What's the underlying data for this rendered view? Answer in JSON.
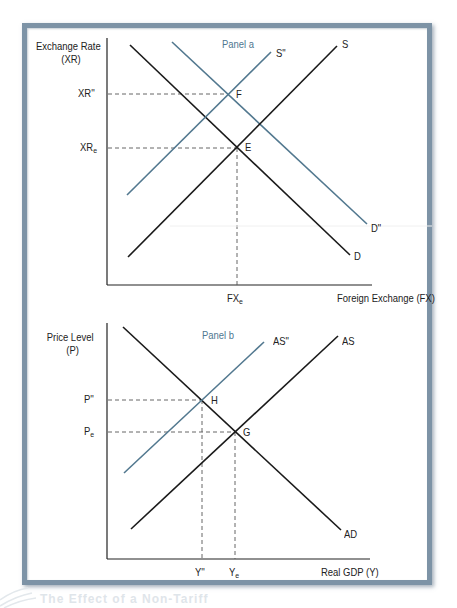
{
  "panel_a": {
    "title": "Panel a",
    "y_axis_label_line1": "Exchange Rate",
    "y_axis_label_line2": "(XR)",
    "x_axis_label": "Foreign Exchange (FX)",
    "y_ticks": [
      {
        "label": "XR''",
        "sub": ""
      },
      {
        "label": "XR",
        "sub": "e"
      }
    ],
    "x_ticks": [
      {
        "label": "FX",
        "sub": "e"
      }
    ],
    "curves": {
      "S": "S",
      "S2": "S\"",
      "D": "D",
      "D2": "D\""
    },
    "points": {
      "E": "E",
      "F": "F"
    }
  },
  "panel_b": {
    "title": "Panel b",
    "y_axis_label_line1": "Price Level",
    "y_axis_label_line2": "(P)",
    "x_axis_label": "Real GDP (Y)",
    "y_ticks": [
      {
        "label": "P''",
        "sub": ""
      },
      {
        "label": "P",
        "sub": "e"
      }
    ],
    "x_ticks": [
      {
        "label": "Y''",
        "sub": ""
      },
      {
        "label": "Y",
        "sub": "e"
      }
    ],
    "curves": {
      "AS": "AS",
      "AS2": "AS\"",
      "AD": "AD"
    },
    "points": {
      "G": "G",
      "H": "H"
    }
  },
  "caption": "The Effect of a Non-Tariff",
  "colors": {
    "black_line": "#1a1a1a",
    "blue_line": "#52788f",
    "dashed": "#555555",
    "frame": "#7d93a6",
    "panel_title": "#4f7791"
  }
}
